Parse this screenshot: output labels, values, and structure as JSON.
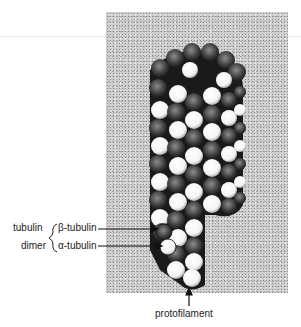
{
  "figure": {
    "labels": {
      "tubulin": "tubulin",
      "dimer": "dimer",
      "beta": "β-tubulin",
      "alpha": "α-tubulin",
      "protofilament": "protofilament"
    }
  }
}
